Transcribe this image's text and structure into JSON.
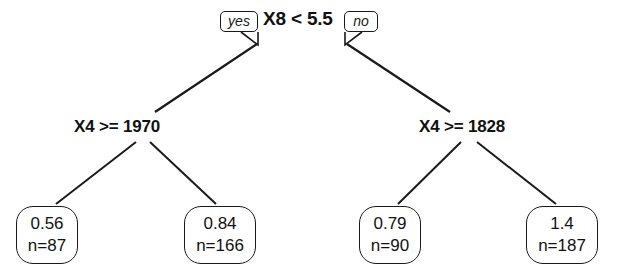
{
  "diagram": {
    "type": "decision-tree",
    "title": "",
    "root": {
      "label": "X8 < 5.5",
      "yes_label": "yes",
      "no_label": "no"
    },
    "splits": [
      {
        "name": "left-split",
        "label": "X4 >= 1970"
      },
      {
        "name": "right-split",
        "label": "X4 >= 1828"
      }
    ],
    "leaves": [
      {
        "value": "0.56",
        "count": "n=87"
      },
      {
        "value": "0.84",
        "count": "n=166"
      },
      {
        "value": "0.79",
        "count": "n=90"
      },
      {
        "value": "1.4",
        "count": "n=187"
      }
    ],
    "colors": {
      "stroke": "#1a1a1a",
      "text": "#111111",
      "background": "#ffffff"
    }
  }
}
